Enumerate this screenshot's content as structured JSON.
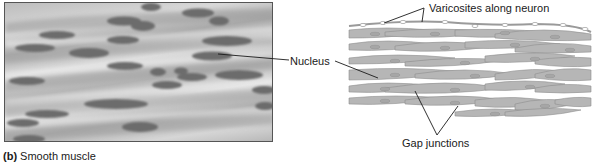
{
  "figure": {
    "caption": {
      "letter": "(b)",
      "title": "Smooth muscle"
    },
    "photo": {
      "description": "micrograph-smooth-muscle-tissue"
    },
    "labels": {
      "nucleus": "Nucleus",
      "varicosites": "Varicosites along neuron",
      "gap_junctions": "Gap junctions"
    },
    "colors": {
      "cell_fill": "#b4b4b4",
      "cell_outline": "#8f8f8f",
      "nucleus_photo": "#6a6a6a",
      "leader_line": "#1a1a1a",
      "background": "#ffffff"
    }
  }
}
